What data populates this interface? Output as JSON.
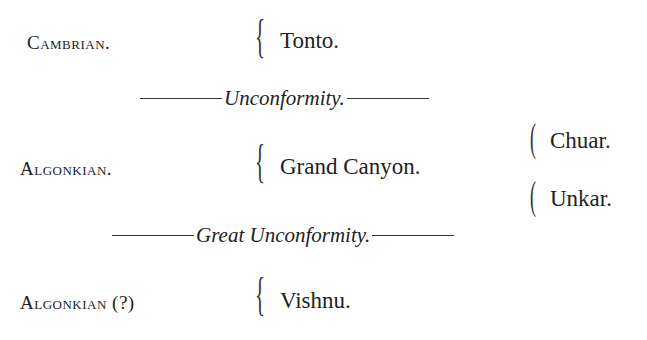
{
  "rows": [
    {
      "era": "Cambrian.",
      "unit": "Tonto."
    },
    {
      "era": "Algonkian.",
      "unit": "Grand Canyon.",
      "subunits": [
        "Chuar.",
        "Unkar."
      ]
    },
    {
      "era": "Algonkian (?)",
      "unit": "Vishnu."
    }
  ],
  "separators": [
    "Unconformity.",
    "Great Unconformity."
  ],
  "braces": {
    "glyph": "{"
  }
}
